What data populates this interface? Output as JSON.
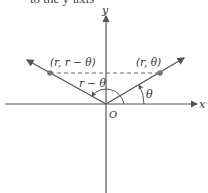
{
  "caption": "to the y-axis",
  "axes": {
    "x_label": "x",
    "y_label": "y",
    "origin_label": "O"
  },
  "points": [
    {
      "id": "p1",
      "label": "(r, r − θ)",
      "x": 50,
      "y": 73
    },
    {
      "id": "p2",
      "label": "(r, θ)",
      "x": 160,
      "y": 73
    }
  ],
  "angles": [
    {
      "id": "theta",
      "label": "θ"
    },
    {
      "id": "r_minus_theta",
      "label": "r − θ"
    }
  ],
  "colors": {
    "ray": "#555555",
    "axis": "#555555",
    "point": "#777777",
    "text": "#333333"
  }
}
